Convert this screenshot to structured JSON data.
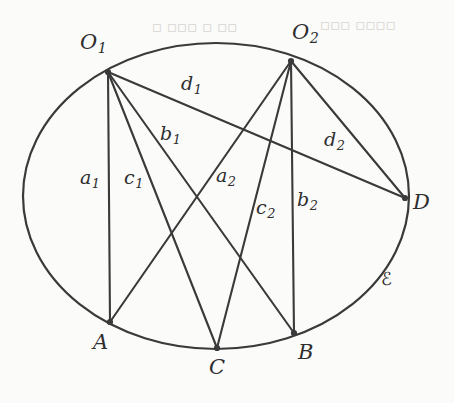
{
  "figure": {
    "curve_label": "ℰ",
    "stroke_color": "#3a3a3a",
    "background_color": "#fbfbfa",
    "vertices": [
      {
        "id": "O1",
        "base": "O",
        "sub": "1",
        "x": 108,
        "y": 72,
        "label_x": 80,
        "label_y": 32
      },
      {
        "id": "O2",
        "base": "O",
        "sub": "2",
        "x": 291,
        "y": 61,
        "label_x": 292,
        "label_y": 22
      },
      {
        "id": "D",
        "base": "D",
        "sub": "",
        "x": 405,
        "y": 198,
        "label_x": 413,
        "label_y": 192
      },
      {
        "id": "A",
        "base": "A",
        "sub": "",
        "x": 110,
        "y": 322,
        "label_x": 93,
        "label_y": 332
      },
      {
        "id": "C",
        "base": "C",
        "sub": "",
        "x": 217,
        "y": 348,
        "label_x": 209,
        "label_y": 357
      },
      {
        "id": "B",
        "base": "B",
        "sub": "",
        "x": 294,
        "y": 333,
        "label_x": 298,
        "label_y": 342
      }
    ],
    "segments": [
      {
        "id": "a1",
        "from": "O1",
        "to": "A",
        "base": "a",
        "sub": "1",
        "label_x": 80,
        "label_y": 168
      },
      {
        "id": "c1",
        "from": "O1",
        "to": "C",
        "base": "c",
        "sub": "1",
        "label_x": 124,
        "label_y": 168
      },
      {
        "id": "b1",
        "from": "O1",
        "to": "B",
        "base": "b",
        "sub": "1",
        "label_x": 160,
        "label_y": 124
      },
      {
        "id": "d1",
        "from": "O1",
        "to": "D",
        "base": "d",
        "sub": "1",
        "label_x": 181,
        "label_y": 74
      },
      {
        "id": "a2",
        "from": "O2",
        "to": "A",
        "base": "a",
        "sub": "2",
        "label_x": 216,
        "label_y": 166
      },
      {
        "id": "c2",
        "from": "O2",
        "to": "C",
        "base": "c",
        "sub": "2",
        "label_x": 256,
        "label_y": 198
      },
      {
        "id": "b2",
        "from": "O2",
        "to": "B",
        "base": "b",
        "sub": "2",
        "label_x": 297,
        "label_y": 190
      },
      {
        "id": "d2",
        "from": "O2",
        "to": "D",
        "base": "d",
        "sub": "2",
        "label_x": 324,
        "label_y": 130
      }
    ],
    "ellipse": {
      "cx": 216,
      "cy": 196,
      "rx": 193,
      "ry": 153,
      "label_x": 381,
      "label_y": 270
    },
    "faint_background_text": [
      {
        "text": "▫ ▫▫▫  ▫ ▫▫",
        "x": 152,
        "y": 18
      },
      {
        "text": "▫▫▫  ▫▫▫▫",
        "x": 320,
        "y": 16
      }
    ]
  }
}
